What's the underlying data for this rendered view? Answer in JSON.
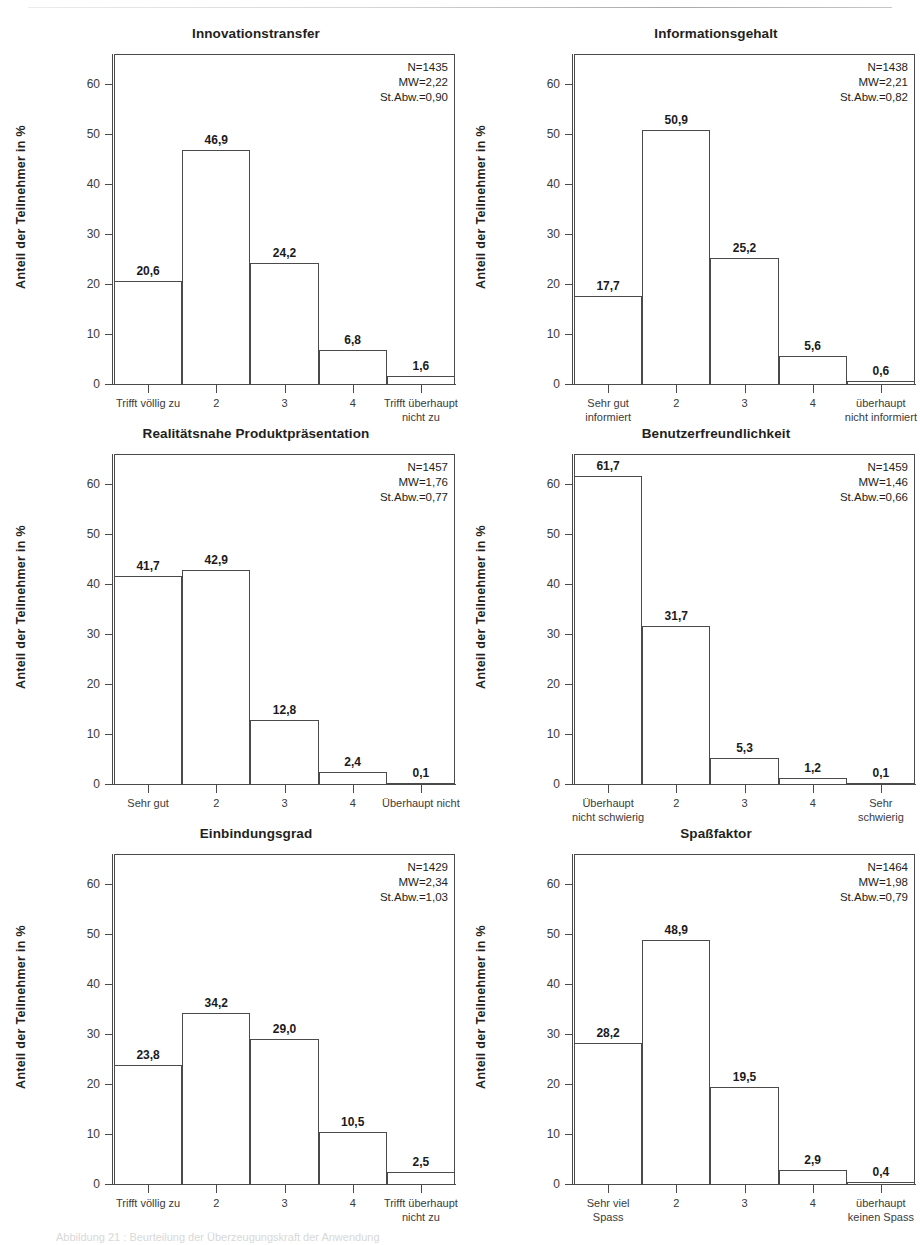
{
  "figure": {
    "caption": "Abbildung 21 : Beurteilung der Überzeugungskraft der Anwendung",
    "ylabel": "Anteil der Teilnehmer in %",
    "y_ticks": [
      "0",
      "10",
      "20",
      "30",
      "40",
      "50",
      "60"
    ],
    "stats_labels": {
      "n": "N=",
      "mean": "MW=",
      "sd": "St.Abw.="
    }
  },
  "chart_data": [
    {
      "type": "bar",
      "title": "Innovationstransfer",
      "ylabel": "Anteil der Teilnehmer in %",
      "xlabel": "",
      "ylim": [
        0,
        66
      ],
      "yticks": [
        0,
        10,
        20,
        30,
        40,
        50,
        60
      ],
      "grid": false,
      "legend": "none",
      "categories": [
        "Trifft völlig zu",
        "2",
        "3",
        "4",
        "Trifft überhaupt nicht zu"
      ],
      "category_lines": [
        [
          "Trifft völlig zu"
        ],
        [
          "2"
        ],
        [
          "3"
        ],
        [
          "4"
        ],
        [
          "Trifft überhaupt",
          "nicht zu"
        ]
      ],
      "values": [
        20.6,
        46.9,
        24.2,
        6.8,
        1.6
      ],
      "value_labels": [
        "20,6",
        "46,9",
        "24,2",
        "6,8",
        "1,6"
      ],
      "annotations": {
        "N": "N=1435",
        "MW": "MW=2,22",
        "StAbw": "St.Abw.=0,90"
      }
    },
    {
      "type": "bar",
      "title": "Informationsgehalt",
      "ylabel": "Anteil der Teilnehmer in %",
      "xlabel": "",
      "ylim": [
        0,
        66
      ],
      "yticks": [
        0,
        10,
        20,
        30,
        40,
        50,
        60
      ],
      "grid": false,
      "legend": "none",
      "categories": [
        "Sehr gut informiert",
        "2",
        "3",
        "4",
        "überhaupt nicht informiert"
      ],
      "category_lines": [
        [
          "Sehr gut",
          "informiert"
        ],
        [
          "2"
        ],
        [
          "3"
        ],
        [
          "4"
        ],
        [
          "überhaupt",
          "nicht informiert"
        ]
      ],
      "values": [
        17.7,
        50.9,
        25.2,
        5.6,
        0.6
      ],
      "value_labels": [
        "17,7",
        "50,9",
        "25,2",
        "5,6",
        "0,6"
      ],
      "annotations": {
        "N": "N=1438",
        "MW": "MW=2,21",
        "StAbw": "St.Abw.=0,82"
      }
    },
    {
      "type": "bar",
      "title": "Realitätsnahe Produktpräsentation",
      "ylabel": "Anteil der Teilnehmer in %",
      "xlabel": "",
      "ylim": [
        0,
        66
      ],
      "yticks": [
        0,
        10,
        20,
        30,
        40,
        50,
        60
      ],
      "grid": false,
      "legend": "none",
      "categories": [
        "Sehr gut",
        "2",
        "3",
        "4",
        "Überhaupt nicht"
      ],
      "category_lines": [
        [
          "Sehr gut"
        ],
        [
          "2"
        ],
        [
          "3"
        ],
        [
          "4"
        ],
        [
          "Überhaupt nicht"
        ]
      ],
      "values": [
        41.7,
        42.9,
        12.8,
        2.4,
        0.1
      ],
      "value_labels": [
        "41,7",
        "42,9",
        "12,8",
        "2,4",
        "0,1"
      ],
      "annotations": {
        "N": "N=1457",
        "MW": "MW=1,76",
        "StAbw": "St.Abw.=0,77"
      }
    },
    {
      "type": "bar",
      "title": "Benutzerfreundlichkeit",
      "ylabel": "Anteil der Teilnehmer in %",
      "xlabel": "",
      "ylim": [
        0,
        66
      ],
      "yticks": [
        0,
        10,
        20,
        30,
        40,
        50,
        60
      ],
      "grid": false,
      "legend": "none",
      "categories": [
        "Überhaupt nicht schwierig",
        "2",
        "3",
        "4",
        "Sehr schwierig"
      ],
      "category_lines": [
        [
          "Überhaupt",
          "nicht schwierig"
        ],
        [
          "2"
        ],
        [
          "3"
        ],
        [
          "4"
        ],
        [
          "Sehr",
          "schwierig"
        ]
      ],
      "values": [
        61.7,
        31.7,
        5.3,
        1.2,
        0.1
      ],
      "value_labels": [
        "61,7",
        "31,7",
        "5,3",
        "1,2",
        "0,1"
      ],
      "annotations": {
        "N": "N=1459",
        "MW": "MW=1,46",
        "StAbw": "St.Abw.=0,66"
      }
    },
    {
      "type": "bar",
      "title": "Einbindungsgrad",
      "ylabel": "Anteil der Teilnehmer in %",
      "xlabel": "",
      "ylim": [
        0,
        66
      ],
      "yticks": [
        0,
        10,
        20,
        30,
        40,
        50,
        60
      ],
      "grid": false,
      "legend": "none",
      "categories": [
        "Trifft völlig zu",
        "2",
        "3",
        "4",
        "Trifft überhaupt nicht zu"
      ],
      "category_lines": [
        [
          "Trifft völlig zu"
        ],
        [
          "2"
        ],
        [
          "3"
        ],
        [
          "4"
        ],
        [
          "Trifft überhaupt",
          "nicht zu"
        ]
      ],
      "values": [
        23.8,
        34.2,
        29.0,
        10.5,
        2.5
      ],
      "value_labels": [
        "23,8",
        "34,2",
        "29,0",
        "10,5",
        "2,5"
      ],
      "annotations": {
        "N": "N=1429",
        "MW": "MW=2,34",
        "StAbw": "St.Abw.=1,03"
      }
    },
    {
      "type": "bar",
      "title": "Spaßfaktor",
      "ylabel": "Anteil der Teilnehmer in %",
      "xlabel": "",
      "ylim": [
        0,
        66
      ],
      "yticks": [
        0,
        10,
        20,
        30,
        40,
        50,
        60
      ],
      "grid": false,
      "legend": "none",
      "categories": [
        "Sehr viel Spass",
        "2",
        "3",
        "4",
        "überhaupt keinen Spass"
      ],
      "category_lines": [
        [
          "Sehr viel",
          "Spass"
        ],
        [
          "2"
        ],
        [
          "3"
        ],
        [
          "4"
        ],
        [
          "überhaupt",
          "keinen Spass"
        ]
      ],
      "values": [
        28.2,
        48.9,
        19.5,
        2.9,
        0.4
      ],
      "value_labels": [
        "28,2",
        "48,9",
        "19,5",
        "2,9",
        "0,4"
      ],
      "annotations": {
        "N": "N=1464",
        "MW": "MW=1,98",
        "StAbw": "St.Abw.=0,79"
      }
    }
  ]
}
